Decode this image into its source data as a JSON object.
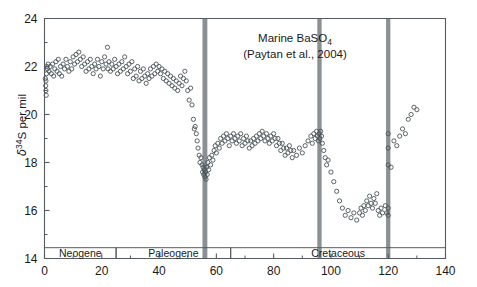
{
  "chart_data": {
    "type": "scatter",
    "title": "Marine BaSO4",
    "title_line1_pre": "Marine BaSO",
    "title_line1_sub": "4",
    "title_line2": "(Paytan et al., 2004)",
    "ylabel_delta": "δ",
    "ylabel_sup": "34",
    "ylabel_rest": "S per mil",
    "ylabel": "δ34S per mil",
    "xlabel": "",
    "xlim": [
      0,
      140
    ],
    "ylim": [
      14,
      24
    ],
    "xticks": [
      0,
      20,
      40,
      60,
      80,
      100,
      120,
      140
    ],
    "xtick_labels": [
      "0",
      "20",
      "40",
      "60",
      "80",
      "100",
      "120",
      "140"
    ],
    "xticks_minor": [
      10,
      30,
      50,
      70,
      90,
      110,
      130
    ],
    "yticks": [
      14,
      16,
      18,
      20,
      22,
      24
    ],
    "ytick_labels": [
      "14",
      "16",
      "18",
      "20",
      "22",
      "24"
    ],
    "yticks_minor": [
      15,
      17,
      19,
      21,
      23
    ],
    "grid": false,
    "legend": false,
    "marker": "open-circle",
    "marker_radius": 2.1,
    "marker_color": "#4a5357",
    "event_band_color": "#8a9094",
    "axis_color": "#555b5e",
    "event_bands": [
      {
        "x": 56,
        "width": 1.7
      },
      {
        "x": 96,
        "width": 1.5
      },
      {
        "x": 120,
        "width": 1.5
      }
    ],
    "period_bands": [
      {
        "label": "Neogene",
        "start": 0,
        "end": 25
      },
      {
        "label": "Paleogene",
        "start": 25,
        "end": 65
      },
      {
        "label": "Cretaceous",
        "start": 65,
        "end": 140
      }
    ],
    "period_band_top": 14.45,
    "series": [
      {
        "name": "Marine barite δ34S",
        "points": [
          [
            0.3,
            21.5
          ],
          [
            0.4,
            21.2
          ],
          [
            0.5,
            21.0
          ],
          [
            0.6,
            20.8
          ],
          [
            0.5,
            21.4
          ],
          [
            0.7,
            21.7
          ],
          [
            0.8,
            22.0
          ],
          [
            1.0,
            21.9
          ],
          [
            1.3,
            22.1
          ],
          [
            1.6,
            21.8
          ],
          [
            2.0,
            22.0
          ],
          [
            2.4,
            21.7
          ],
          [
            2.8,
            22.1
          ],
          [
            3.2,
            21.6
          ],
          [
            3.6,
            21.9
          ],
          [
            4.0,
            22.2
          ],
          [
            4.4,
            21.8
          ],
          [
            4.8,
            22.3
          ],
          [
            5.2,
            21.7
          ],
          [
            5.6,
            22.0
          ],
          [
            6.0,
            21.6
          ],
          [
            6.5,
            22.1
          ],
          [
            7.0,
            21.9
          ],
          [
            7.5,
            22.3
          ],
          [
            8.0,
            22.0
          ],
          [
            8.5,
            21.8
          ],
          [
            9.0,
            22.2
          ],
          [
            9.5,
            21.9
          ],
          [
            10.0,
            22.4
          ],
          [
            10.5,
            22.1
          ],
          [
            11.0,
            22.5
          ],
          [
            11.5,
            22.2
          ],
          [
            12.0,
            22.6
          ],
          [
            12.5,
            22.3
          ],
          [
            13.0,
            22.0
          ],
          [
            13.5,
            22.4
          ],
          [
            14.0,
            22.1
          ],
          [
            14.5,
            21.8
          ],
          [
            15.0,
            22.2
          ],
          [
            15.5,
            21.9
          ],
          [
            16.0,
            22.3
          ],
          [
            16.5,
            22.0
          ],
          [
            17.0,
            21.7
          ],
          [
            17.5,
            22.1
          ],
          [
            18.0,
            21.9
          ],
          [
            18.5,
            22.3
          ],
          [
            19.0,
            22.0
          ],
          [
            19.5,
            21.6
          ],
          [
            20.0,
            22.2
          ],
          [
            20.5,
            21.9
          ],
          [
            21.0,
            22.4
          ],
          [
            21.5,
            22.1
          ],
          [
            22.0,
            22.8
          ],
          [
            22.2,
            21.9
          ],
          [
            22.5,
            22.2
          ],
          [
            23.0,
            21.8
          ],
          [
            23.5,
            22.1
          ],
          [
            24.0,
            21.9
          ],
          [
            24.5,
            22.3
          ],
          [
            25.0,
            22.0
          ],
          [
            25.5,
            21.7
          ],
          [
            26.0,
            22.1
          ],
          [
            26.5,
            21.8
          ],
          [
            27.0,
            22.2
          ],
          [
            27.5,
            21.9
          ],
          [
            28.0,
            22.4
          ],
          [
            28.5,
            22.0
          ],
          [
            29.0,
            21.7
          ],
          [
            29.5,
            22.1
          ],
          [
            30.0,
            21.8
          ],
          [
            30.5,
            22.2
          ],
          [
            31.0,
            21.5
          ],
          [
            31.5,
            21.9
          ],
          [
            32.0,
            21.6
          ],
          [
            32.5,
            22.0
          ],
          [
            33.0,
            21.4
          ],
          [
            33.5,
            21.8
          ],
          [
            34.0,
            21.5
          ],
          [
            34.5,
            21.9
          ],
          [
            35.0,
            21.6
          ],
          [
            35.5,
            21.3
          ],
          [
            36.0,
            21.7
          ],
          [
            36.5,
            21.5
          ],
          [
            37.0,
            21.9
          ],
          [
            37.5,
            21.6
          ],
          [
            38.0,
            22.0
          ],
          [
            38.5,
            21.7
          ],
          [
            39.0,
            22.1
          ],
          [
            39.5,
            21.8
          ],
          [
            40.0,
            22.0
          ],
          [
            40.5,
            21.7
          ],
          [
            41.0,
            21.9
          ],
          [
            41.5,
            21.5
          ],
          [
            42.0,
            21.8
          ],
          [
            42.5,
            21.4
          ],
          [
            43.0,
            21.7
          ],
          [
            43.5,
            21.3
          ],
          [
            44.0,
            21.6
          ],
          [
            44.5,
            21.2
          ],
          [
            45.0,
            21.5
          ],
          [
            45.5,
            21.1
          ],
          [
            46.0,
            21.4
          ],
          [
            46.5,
            21.0
          ],
          [
            47.0,
            21.3
          ],
          [
            47.5,
            21.6
          ],
          [
            48.0,
            21.2
          ],
          [
            48.5,
            21.5
          ],
          [
            49.0,
            21.8
          ],
          [
            49.5,
            21.4
          ],
          [
            50.0,
            21.0
          ],
          [
            50.5,
            20.6
          ],
          [
            51.0,
            21.1
          ],
          [
            51.5,
            20.4
          ],
          [
            52.0,
            19.8
          ],
          [
            52.3,
            19.4
          ],
          [
            52.6,
            19.5
          ],
          [
            53.0,
            19.2
          ],
          [
            53.3,
            18.9
          ],
          [
            53.6,
            18.6
          ],
          [
            54.0,
            18.3
          ],
          [
            54.3,
            18.0
          ],
          [
            54.6,
            18.2
          ],
          [
            55.0,
            17.9
          ],
          [
            55.2,
            17.6
          ],
          [
            55.4,
            17.8
          ],
          [
            55.6,
            17.5
          ],
          [
            55.8,
            17.7
          ],
          [
            56.0,
            17.4
          ],
          [
            56.2,
            17.6
          ],
          [
            56.4,
            17.3
          ],
          [
            56.6,
            17.8
          ],
          [
            56.8,
            17.5
          ],
          [
            57.0,
            18.0
          ],
          [
            57.3,
            17.7
          ],
          [
            57.6,
            18.2
          ],
          [
            58.0,
            17.9
          ],
          [
            58.4,
            18.3
          ],
          [
            58.8,
            18.1
          ],
          [
            59.2,
            18.5
          ],
          [
            59.6,
            18.7
          ],
          [
            60.0,
            18.4
          ],
          [
            60.5,
            18.8
          ],
          [
            61.0,
            18.6
          ],
          [
            61.5,
            19.0
          ],
          [
            62.0,
            18.8
          ],
          [
            62.5,
            19.1
          ],
          [
            63.0,
            18.9
          ],
          [
            63.5,
            19.2
          ],
          [
            64.0,
            19.0
          ],
          [
            64.5,
            18.7
          ],
          [
            65.0,
            19.1
          ],
          [
            65.5,
            18.9
          ],
          [
            66.0,
            19.2
          ],
          [
            66.5,
            19.0
          ],
          [
            67.0,
            18.8
          ],
          [
            67.5,
            19.1
          ],
          [
            68.0,
            18.9
          ],
          [
            68.5,
            19.2
          ],
          [
            69.0,
            18.7
          ],
          [
            69.5,
            19.0
          ],
          [
            70.0,
            18.8
          ],
          [
            70.5,
            19.1
          ],
          [
            71.0,
            18.9
          ],
          [
            71.5,
            18.6
          ],
          [
            72.0,
            18.9
          ],
          [
            72.5,
            18.7
          ],
          [
            73.0,
            19.0
          ],
          [
            73.5,
            18.8
          ],
          [
            74.0,
            19.1
          ],
          [
            74.5,
            18.9
          ],
          [
            75.0,
            19.2
          ],
          [
            75.5,
            19.0
          ],
          [
            76.0,
            19.3
          ],
          [
            76.5,
            19.1
          ],
          [
            77.0,
            18.9
          ],
          [
            77.5,
            19.2
          ],
          [
            78.0,
            19.0
          ],
          [
            78.5,
            18.8
          ],
          [
            79.0,
            19.1
          ],
          [
            79.5,
            18.9
          ],
          [
            80.0,
            19.2
          ],
          [
            80.5,
            19.0
          ],
          [
            81.0,
            18.7
          ],
          [
            81.5,
            19.0
          ],
          [
            82.0,
            18.8
          ],
          [
            82.5,
            18.5
          ],
          [
            83.0,
            18.8
          ],
          [
            83.5,
            18.6
          ],
          [
            84.0,
            18.3
          ],
          [
            84.5,
            18.6
          ],
          [
            85.0,
            18.4
          ],
          [
            85.5,
            18.7
          ],
          [
            86.0,
            18.5
          ],
          [
            86.5,
            18.2
          ],
          [
            87.0,
            18.5
          ],
          [
            88.0,
            18.3
          ],
          [
            89.0,
            18.6
          ],
          [
            90.0,
            18.4
          ],
          [
            91.0,
            18.7
          ],
          [
            92.0,
            18.9
          ],
          [
            93.0,
            19.1
          ],
          [
            93.5,
            18.8
          ],
          [
            94.0,
            19.2
          ],
          [
            94.5,
            19.0
          ],
          [
            95.0,
            19.3
          ],
          [
            95.3,
            19.1
          ],
          [
            95.6,
            18.9
          ],
          [
            95.9,
            19.2
          ],
          [
            96.1,
            19.0
          ],
          [
            96.4,
            19.3
          ],
          [
            96.7,
            19.1
          ],
          [
            97.0,
            18.8
          ],
          [
            97.5,
            18.5
          ],
          [
            98.0,
            18.2
          ],
          [
            98.5,
            17.9
          ],
          [
            99.0,
            18.1
          ],
          [
            100.0,
            17.6
          ],
          [
            101.0,
            17.2
          ],
          [
            102.0,
            16.8
          ],
          [
            103.0,
            16.4
          ],
          [
            104.0,
            16.1
          ],
          [
            105.0,
            15.8
          ],
          [
            106.0,
            16.0
          ],
          [
            107.0,
            15.7
          ],
          [
            108.0,
            15.9
          ],
          [
            109.0,
            15.6
          ],
          [
            110.0,
            15.9
          ],
          [
            110.5,
            16.1
          ],
          [
            111.0,
            15.8
          ],
          [
            111.5,
            16.2
          ],
          [
            112.0,
            16.0
          ],
          [
            112.5,
            16.4
          ],
          [
            113.0,
            16.2
          ],
          [
            113.5,
            16.6
          ],
          [
            114.0,
            16.3
          ],
          [
            114.5,
            16.1
          ],
          [
            115.0,
            16.5
          ],
          [
            115.5,
            16.3
          ],
          [
            116.0,
            16.7
          ],
          [
            116.5,
            16.0
          ],
          [
            117.0,
            15.8
          ],
          [
            117.5,
            16.1
          ],
          [
            118.0,
            15.9
          ],
          [
            119.0,
            16.2
          ],
          [
            119.5,
            15.9
          ],
          [
            120.0,
            16.1
          ],
          [
            120.0,
            15.8
          ],
          [
            120.0,
            17.9
          ],
          [
            120.0,
            18.6
          ],
          [
            120.0,
            19.2
          ],
          [
            121.0,
            17.8
          ],
          [
            122.0,
            18.9
          ],
          [
            123.0,
            18.7
          ],
          [
            124.0,
            19.1
          ],
          [
            125.0,
            19.4
          ],
          [
            126.0,
            19.2
          ],
          [
            127.0,
            19.8
          ],
          [
            128.0,
            20.0
          ],
          [
            129.0,
            20.3
          ],
          [
            130.0,
            20.2
          ]
        ]
      }
    ]
  }
}
